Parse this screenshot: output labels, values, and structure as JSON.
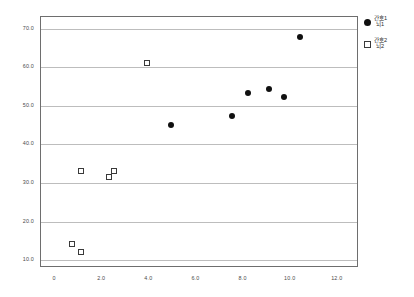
{
  "chart_data": {
    "type": "scatter",
    "title": "",
    "xlabel": "",
    "ylabel": "",
    "xlim": [
      -0.6,
      12.9
    ],
    "ylim": [
      8.0,
      73.0
    ],
    "grid": "horizontal",
    "legend_position": "right",
    "xticks": [
      "0",
      "2.0",
      "4.0",
      "6.0",
      "8.0",
      "10.0",
      "12.0"
    ],
    "xtick_values": [
      0,
      2,
      4,
      6,
      8,
      10,
      12
    ],
    "yticks": [
      "10.0",
      "20.0",
      "30.0",
      "40.0",
      "50.0",
      "60.0",
      "70.0"
    ],
    "ytick_values": [
      10,
      20,
      30,
      40,
      50,
      60,
      70
    ],
    "series": [
      {
        "name": "간호1 뇌1",
        "marker": "filled-circle",
        "color": "#101010",
        "points": [
          {
            "x": 4.9,
            "y": 45.1
          },
          {
            "x": 7.5,
            "y": 47.4
          },
          {
            "x": 8.2,
            "y": 53.2
          },
          {
            "x": 9.1,
            "y": 54.3
          },
          {
            "x": 9.7,
            "y": 52.2
          },
          {
            "x": 10.4,
            "y": 67.7
          }
        ]
      },
      {
        "name": "간호2 뇌2",
        "marker": "open-square",
        "color": "#3a3a3a",
        "points": [
          {
            "x": 0.7,
            "y": 14.3
          },
          {
            "x": 1.1,
            "y": 12.2
          },
          {
            "x": 1.1,
            "y": 33.2
          },
          {
            "x": 2.3,
            "y": 31.6
          },
          {
            "x": 2.5,
            "y": 33.2
          },
          {
            "x": 3.9,
            "y": 61.0
          }
        ]
      }
    ]
  },
  "legend": {
    "entries": [
      {
        "line1": "간호1",
        "line2": "뇌1"
      },
      {
        "line1": "간호2",
        "line2": "뇌2"
      }
    ]
  }
}
